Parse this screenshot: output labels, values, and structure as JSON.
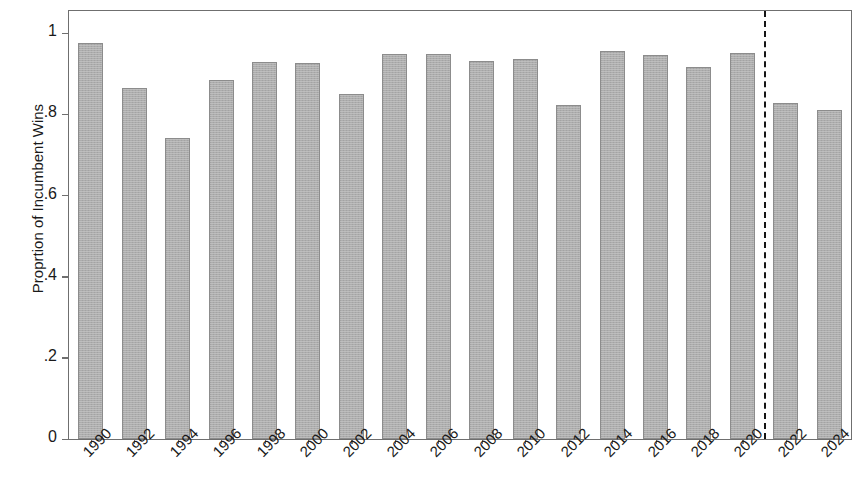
{
  "chart_data": {
    "type": "bar",
    "title": "",
    "xlabel": "",
    "ylabel": "Proprtion of Incumbent Wins",
    "categories": [
      "1990",
      "1992",
      "1994",
      "1996",
      "1998",
      "2000",
      "2002",
      "2004",
      "2006",
      "2008",
      "2010",
      "2012",
      "2014",
      "2016",
      "2018",
      "2020",
      "2022",
      "2024"
    ],
    "values": [
      0.975,
      0.865,
      0.741,
      0.885,
      0.929,
      0.928,
      0.851,
      0.949,
      0.948,
      0.932,
      0.937,
      0.824,
      0.957,
      0.946,
      0.918,
      0.951,
      0.828,
      0.81
    ],
    "ylim": [
      0,
      1.055
    ],
    "yticks": [
      0,
      0.2,
      0.4,
      0.6,
      0.8,
      1
    ],
    "ytick_labels": [
      "0",
      ".2",
      ".4",
      ".6",
      ".8",
      "1"
    ],
    "grid": false,
    "legend": null,
    "bar_color": "#adadad",
    "bar_border_color": "#8c8c8c",
    "axis_color": "#6f6f6f",
    "annotations": [
      {
        "name": "forecast-divider",
        "type": "vertical-dashed-line",
        "between_categories": [
          "2020",
          "2022"
        ],
        "color": "#151515"
      }
    ]
  }
}
